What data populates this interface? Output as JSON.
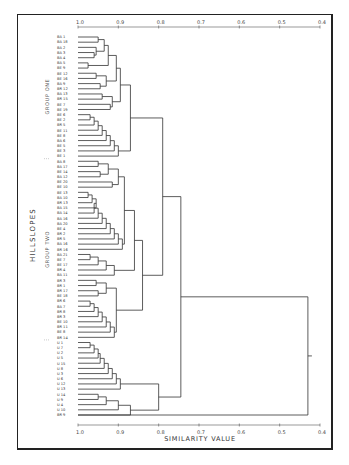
{
  "chart_data": {
    "type": "dendrogram",
    "title": "",
    "xlabel": "SIMILARITY   VALUE",
    "ylabel": "HILLSLOPES",
    "axis": {
      "ticks": [
        "1.0",
        "0.9",
        "0.8",
        "0.7",
        "0.6",
        "0.5",
        "0.4"
      ],
      "tick_values": [
        1.0,
        0.9,
        0.8,
        0.7,
        0.6,
        0.5,
        0.4
      ],
      "range": [
        1.0,
        0.4
      ],
      "position": [
        "top",
        "bottom"
      ],
      "grid": false
    },
    "groups": [
      {
        "name": "GROUP ONE",
        "first_leaf": 0,
        "last_leaf": 23
      },
      {
        "name": "GROUP TWO",
        "first_leaf": 24,
        "last_leaf": 58
      }
    ],
    "leaves": [
      "BA 1",
      "BA 18",
      "BA 2",
      "BA 3",
      "BA 4",
      "BA 5",
      "BE 9",
      "BE 12",
      "BE 16",
      "BA 9",
      "BR 12",
      "BA 13",
      "BR 15",
      "BE 7",
      "BE 19",
      "BE 6",
      "BE 2",
      "BR 5",
      "BE 11",
      "BE 8",
      "BA 6",
      "BE 5",
      "BE 3",
      "BE 1",
      "BA 8",
      "BA 17",
      "BE 14",
      "BA 12",
      "BE 20",
      "BE 10",
      "BE 13",
      "BA 10",
      "BR 13",
      "BA 15",
      "BA 14",
      "BA 16",
      "BA 20",
      "BE 4",
      "BR 2",
      "BR 5",
      "BA 16",
      "BR 16",
      "BA 21",
      "BE 7",
      "BE 17",
      "BR 4",
      "BA 11",
      "BR 3",
      "BR 1",
      "BR 17",
      "BE 18",
      "BR 6",
      "BA 7",
      "BR 8",
      "BR 3",
      "BE 10",
      "BR 11",
      "BE 8",
      "BR 14",
      "U 1",
      "U 7",
      "U 2",
      "U 5",
      "U 15",
      "U 8",
      "U 3",
      "U 6",
      "U 12",
      "U 13",
      "U 14",
      "U 9",
      "U 4",
      "U 10",
      "BR 9"
    ]
  },
  "figure": {
    "left_label": "HILLSLOPES",
    "group_one_label": "GROUP ONE",
    "group_two_label": "GROUP TWO",
    "bottom_title": "SIMILARITY   VALUE"
  }
}
